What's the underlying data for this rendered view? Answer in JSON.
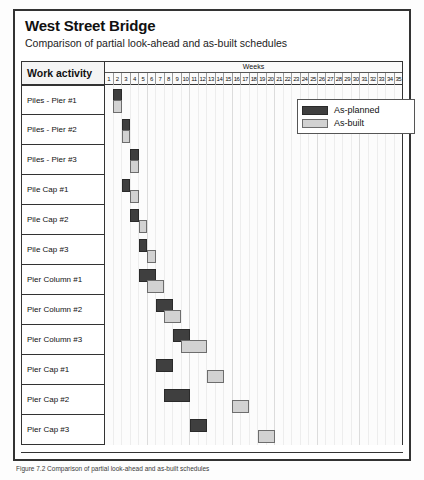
{
  "figure": {
    "title": "West Street Bridge",
    "subtitle": "Comparison of partial look-ahead and as-built schedules",
    "caption": "Figure 7.2  Comparison of partial look-ahead and as-built schedules"
  },
  "table": {
    "activity_header": "Work activity",
    "weeks_header": "Weeks",
    "week_ticks": [
      "1",
      "2",
      "3",
      "4",
      "5",
      "6",
      "7",
      "8",
      "9",
      "10",
      "11",
      "12",
      "13",
      "14",
      "15",
      "16",
      "17",
      "18",
      "19",
      "20",
      "21",
      "22",
      "23",
      "24",
      "25",
      "26",
      "27",
      "28",
      "29",
      "30",
      "31",
      "32",
      "33",
      "34",
      "35"
    ]
  },
  "legend": {
    "items": [
      {
        "key": "planned",
        "label": "As-planned",
        "color": "#3f3f3f"
      },
      {
        "key": "built",
        "label": "As-built",
        "color": "#d2d2d2"
      }
    ]
  },
  "chart_data": {
    "type": "bar",
    "title": "West Street Bridge",
    "subtitle": "Comparison of partial look-ahead and as-built schedules",
    "xlabel": "Weeks",
    "ylabel": "Work activity",
    "xlim": [
      1,
      36
    ],
    "grid": true,
    "legend_position": "top-right",
    "categories": [
      "Piles - Pier #1",
      "Piles - Pier #2",
      "Piles - Pier #3",
      "Pile Cap #1",
      "Pile Cap #2",
      "Pile Cap #3",
      "Pier Column #1",
      "Pier Column #2",
      "Pier Column #3",
      "Pier Cap #1",
      "Pier Cap #2",
      "Pier Cap #3"
    ],
    "series": [
      {
        "name": "As-planned",
        "color": "#3f3f3f",
        "bars": [
          {
            "activity": "Piles - Pier #1",
            "start_week": 2,
            "end_week": 3,
            "duration_weeks": 1
          },
          {
            "activity": "Piles - Pier #2",
            "start_week": 3,
            "end_week": 4,
            "duration_weeks": 1
          },
          {
            "activity": "Piles - Pier #3",
            "start_week": 4,
            "end_week": 5,
            "duration_weeks": 1
          },
          {
            "activity": "Pile Cap #1",
            "start_week": 3,
            "end_week": 4,
            "duration_weeks": 1
          },
          {
            "activity": "Pile Cap #2",
            "start_week": 4,
            "end_week": 5,
            "duration_weeks": 1
          },
          {
            "activity": "Pile Cap #3",
            "start_week": 5,
            "end_week": 6,
            "duration_weeks": 1
          },
          {
            "activity": "Pier Column #1",
            "start_week": 5,
            "end_week": 7,
            "duration_weeks": 2
          },
          {
            "activity": "Pier Column #2",
            "start_week": 7,
            "end_week": 9,
            "duration_weeks": 2
          },
          {
            "activity": "Pier Column #3",
            "start_week": 9,
            "end_week": 11,
            "duration_weeks": 2
          },
          {
            "activity": "Pier Cap #1",
            "start_week": 7,
            "end_week": 9,
            "duration_weeks": 2
          },
          {
            "activity": "Pier Cap #2",
            "start_week": 8,
            "end_week": 11,
            "duration_weeks": 3
          },
          {
            "activity": "Pier Cap #3",
            "start_week": 11,
            "end_week": 13,
            "duration_weeks": 2
          }
        ]
      },
      {
        "name": "As-built",
        "color": "#d2d2d2",
        "bars": [
          {
            "activity": "Piles - Pier #1",
            "start_week": 2,
            "end_week": 3,
            "duration_weeks": 1
          },
          {
            "activity": "Piles - Pier #2",
            "start_week": 3,
            "end_week": 4,
            "duration_weeks": 1
          },
          {
            "activity": "Piles - Pier #3",
            "start_week": 4,
            "end_week": 5,
            "duration_weeks": 1
          },
          {
            "activity": "Pile Cap #1",
            "start_week": 4,
            "end_week": 5,
            "duration_weeks": 1
          },
          {
            "activity": "Pile Cap #2",
            "start_week": 5,
            "end_week": 6,
            "duration_weeks": 1
          },
          {
            "activity": "Pile Cap #3",
            "start_week": 6,
            "end_week": 7,
            "duration_weeks": 1
          },
          {
            "activity": "Pier Column #1",
            "start_week": 6,
            "end_week": 8,
            "duration_weeks": 2
          },
          {
            "activity": "Pier Column #2",
            "start_week": 8,
            "end_week": 10,
            "duration_weeks": 2
          },
          {
            "activity": "Pier Column #3",
            "start_week": 10,
            "end_week": 13,
            "duration_weeks": 3
          },
          {
            "activity": "Pier Cap #1",
            "start_week": 13,
            "end_week": 15,
            "duration_weeks": 2
          },
          {
            "activity": "Pier Cap #2",
            "start_week": 16,
            "end_week": 18,
            "duration_weeks": 2
          },
          {
            "activity": "Pier Cap #3",
            "start_week": 19,
            "end_week": 21,
            "duration_weeks": 2
          }
        ]
      }
    ]
  }
}
